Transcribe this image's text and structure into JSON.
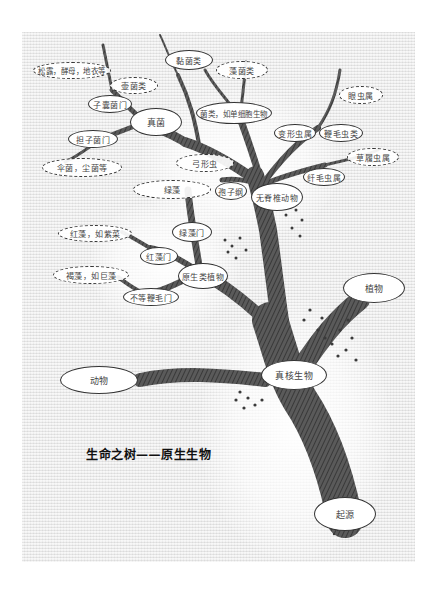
{
  "title": "生命之树——原生生物",
  "nodes": {
    "root": "起源",
    "eukaryote": "真核生物",
    "animal": "动物",
    "plant": "植物",
    "protist_plants": "原生类植物",
    "invertebrates": "无脊椎动物",
    "fungi": "真菌",
    "stramenopiles": "不等鞭毛门",
    "red_algae_phylum": "红藻门",
    "green_algae_phylum": "绿藻门",
    "spore_class": "孢子纲",
    "ciliates": "纤毛虫属",
    "amoeba": "变形虫属",
    "flagellates": "鞭毛虫类",
    "slime_molds": "黏菌类",
    "bacteria_like": "菌类，如单细胞生物",
    "ascomycota": "子囊菌门",
    "basidiomycota": "担子菌门",
    "truffles": "松露，酵母，地衣等",
    "chytrids": "壶菌类",
    "algae_fungi": "藻菌类",
    "eye_worm": "眼虫属",
    "trypanosome": "草履虫属",
    "toxoplasma": "弓形虫",
    "green_algae": "绿藻",
    "mushrooms": "伞菌，尘菌等",
    "red_algae_eg": "红藻，如紫菜",
    "brown_algae_eg": "褐藻，如巨藻"
  },
  "colors": {
    "paper": "#e9e9e9",
    "ink": "#333333",
    "bark": "#4a4a4a"
  }
}
